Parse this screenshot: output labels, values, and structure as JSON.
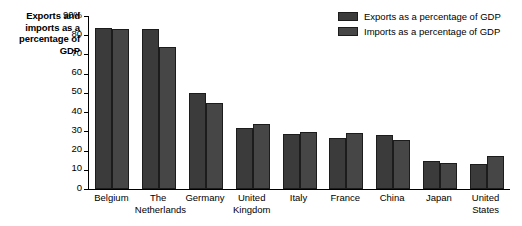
{
  "chart_data": {
    "type": "bar",
    "title": "Exports and imports as a percentage of GDP",
    "xlabel": "",
    "ylabel": "Exports and imports as a percentage of GDP",
    "ylim": [
      0,
      90
    ],
    "yticks": [
      "0",
      "10",
      "20",
      "30",
      "40",
      "50",
      "60",
      "70",
      "80",
      "90%"
    ],
    "ytick_values": [
      0,
      10,
      20,
      30,
      40,
      50,
      60,
      70,
      80,
      90
    ],
    "grid": false,
    "legend_position": "top-right",
    "categories": [
      "Belgium",
      "The Netherlands",
      "Germany",
      "United Kingdom",
      "Italy",
      "France",
      "China",
      "Japan",
      "United States"
    ],
    "series": [
      {
        "name": "Exports as a percentage of GDP",
        "color": "#3b3b3b",
        "values": [
          84,
          83,
          50,
          32,
          28.5,
          26.5,
          28,
          14.5,
          13
        ]
      },
      {
        "name": "Imports as a percentage of GDP",
        "color": "#464646",
        "values": [
          83,
          74,
          45,
          34,
          29.5,
          29,
          25.5,
          13.5,
          17
        ]
      }
    ]
  },
  "axis": {
    "y_title_lines": "Exports and\nimports as a\npercentage of\nGDP"
  },
  "colors": {
    "exports": "#3b3b3b",
    "imports": "#464646",
    "axis": "#000000",
    "background": "#ffffff"
  }
}
